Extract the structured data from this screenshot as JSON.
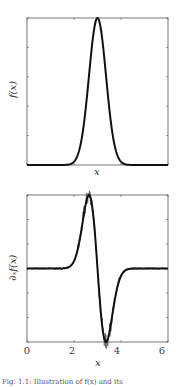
{
  "chart_data": [
    {
      "type": "line",
      "title": "",
      "xlabel": "x",
      "ylabel": "f(x)",
      "xlim": [
        0,
        6.283
      ],
      "ylim": [
        0,
        1
      ],
      "xticks_visible_labels": false,
      "grid": false,
      "series": [
        {
          "name": "f(x)",
          "function": "gaussian",
          "center": 3.1416,
          "sigma": 0.38,
          "amplitude": 1.0,
          "color": "#111111",
          "linewidth": 2
        }
      ]
    },
    {
      "type": "line",
      "title": "",
      "xlabel": "x",
      "ylabel": "∂ₓf(x)",
      "xlim": [
        0,
        6.283
      ],
      "ylim": [
        -1,
        1
      ],
      "xticks": [
        0,
        2,
        4,
        6
      ],
      "grid": false,
      "series": [
        {
          "name": "∂ₓf(x) exact",
          "function": "gaussian-derivative",
          "center": 3.1416,
          "sigma": 0.38,
          "peak_x": 2.78,
          "trough_x": 3.52,
          "color": "#111111",
          "linewidth": 2
        },
        {
          "name": "∂ₓf(x) noisy estimate",
          "function": "noise",
          "noise_region": [
            2.2,
            4.1
          ],
          "noise_amplitude": 0.12,
          "color": "#555555",
          "linewidth": 0.7
        }
      ]
    }
  ],
  "labels": {
    "top": {
      "ylabel": "f(x)",
      "xlabel": "x"
    },
    "bottom": {
      "ylabel": "∂ₓf(x)",
      "xlabel": "x",
      "ticks": [
        "0",
        "2",
        "4",
        "6"
      ]
    },
    "caption": "Fig. 1.1: Illustration of f(x) and its"
  }
}
